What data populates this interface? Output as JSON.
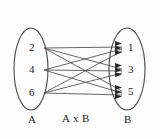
{
  "figure": {
    "title_label": "A x B"
  },
  "sets": {
    "left": {
      "name": "A",
      "label_position": {
        "x": 30,
        "y": 112
      },
      "ellipse": {
        "cx": 31,
        "cy": 69,
        "rx": 17,
        "ry": 41
      },
      "elements": [
        {
          "value": "2",
          "x": 33,
          "y": 43,
          "node_x": 44,
          "node_y": 48
        },
        {
          "value": "4",
          "x": 33,
          "y": 65,
          "node_x": 44,
          "node_y": 70
        },
        {
          "value": "6",
          "x": 33,
          "y": 88,
          "node_x": 44,
          "node_y": 93
        }
      ]
    },
    "right": {
      "name": "B",
      "label_position": {
        "x": 125,
        "y": 112
      },
      "ellipse": {
        "cx": 127,
        "cy": 69,
        "rx": 18,
        "ry": 41
      },
      "elements": [
        {
          "value": "1",
          "x": 131,
          "y": 43,
          "node_x": 128,
          "node_y": 48
        },
        {
          "value": "3",
          "x": 131,
          "y": 65,
          "node_x": 128,
          "node_y": 70
        },
        {
          "value": "5",
          "x": 131,
          "y": 88,
          "node_x": 128,
          "node_y": 92
        }
      ]
    }
  },
  "relation": {
    "label": "A x B",
    "label_position": {
      "x": 62,
      "y": 112
    },
    "type": "complete-bipartite",
    "pairs": [
      {
        "from": "2",
        "to": "1"
      },
      {
        "from": "2",
        "to": "3"
      },
      {
        "from": "2",
        "to": "5"
      },
      {
        "from": "4",
        "to": "1"
      },
      {
        "from": "4",
        "to": "3"
      },
      {
        "from": "4",
        "to": "5"
      },
      {
        "from": "6",
        "to": "1"
      },
      {
        "from": "6",
        "to": "3"
      },
      {
        "from": "6",
        "to": "5"
      }
    ]
  },
  "colors": {
    "background": "#fdfdfd",
    "stroke": "#4b4b4b",
    "ellipse_stroke": "#4a4a4a",
    "arrow_fill": "#2a2a2a",
    "text": "#1c1c1c"
  }
}
